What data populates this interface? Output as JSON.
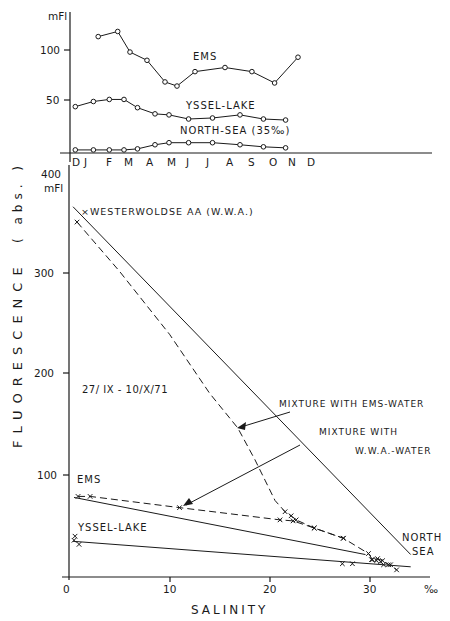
{
  "chart_data": [
    {
      "type": "line",
      "title": "Seasonal fluorescence",
      "xlabel": "",
      "ylabel": "mFl",
      "ylim": [
        0,
        125
      ],
      "yticks": [
        50,
        100
      ],
      "ytick_labels": [
        "50",
        "100"
      ],
      "y_unit_label": "mFl",
      "categories": [
        "D",
        "J",
        "F",
        "M",
        "A",
        "M",
        "J",
        "J",
        "A",
        "S",
        "O",
        "N",
        "D"
      ],
      "grid": false,
      "marker": "open-circle",
      "series": [
        {
          "name": "EMS",
          "x": [
            1.7,
            2.7,
            3.4,
            4.4,
            5.3,
            5.9,
            7.0,
            8.2,
            9.3,
            10.3,
            11.4
          ],
          "values": [
            113,
            118,
            98,
            90,
            69,
            65,
            79,
            83,
            79,
            68,
            93
          ]
        },
        {
          "name": "YSSEL-LAKE",
          "x": [
            0.1,
            1.4,
            2.3,
            3.0,
            3.9,
            4.8,
            5.5,
            6.6,
            7.7,
            8.8,
            9.8,
            10.8
          ],
          "values": [
            45,
            50,
            52,
            52,
            44,
            38,
            37,
            33,
            34,
            37,
            33,
            32
          ]
        },
        {
          "name": "NORTH-SEA (35‰)",
          "x": [
            0.1,
            1.4,
            2.3,
            3.0,
            3.9,
            4.8,
            5.5,
            6.6,
            7.7,
            8.8,
            9.8,
            10.8
          ],
          "values": [
            3,
            3,
            3,
            3,
            4,
            8,
            10,
            10,
            10,
            8,
            6,
            5
          ]
        }
      ],
      "annotations": [
        "EMS",
        "YSSEL-LAKE",
        "NORTH-SEA (35‰)"
      ]
    },
    {
      "type": "scatter",
      "title": "Fluorescence vs salinity",
      "xlabel": "SALINITY",
      "x_unit_label": "‰",
      "ylabel": "FLUORESCENCE (abs.)",
      "y_unit_label": "mFl",
      "xlim": [
        0,
        36
      ],
      "ylim": [
        0,
        400
      ],
      "xticks": [
        0,
        10,
        20,
        30
      ],
      "yticks": [
        100,
        200,
        300,
        400
      ],
      "grid": false,
      "series": [
        {
          "name": "Westerwoldse AA - North Sea mixing line",
          "style": "solid",
          "x": [
            0.4,
            34
          ],
          "values": [
            363,
            22
          ]
        },
        {
          "name": "Ems - North Sea mixing line",
          "style": "solid",
          "x": [
            0.5,
            29.5
          ],
          "values": [
            78,
            22
          ]
        },
        {
          "name": "Yssel-Lake - North Sea mixing line",
          "style": "solid",
          "x": [
            0.4,
            34
          ],
          "values": [
            35,
            10
          ]
        },
        {
          "name": "Mixture with W.W.A.-water (observed)",
          "style": "dashed",
          "marker": "x",
          "x": [
            0.8,
            5,
            10,
            14,
            16.8,
            18.5,
            19.5,
            20.5,
            21.5,
            22.1,
            22.6,
            24.4,
            27.3,
            29.8,
            30.2,
            30.7,
            31.2,
            31.8,
            32.6
          ],
          "values": [
            348,
            300,
            238,
            180,
            146,
            115,
            95,
            75,
            64,
            60,
            56,
            48,
            38,
            23,
            17,
            18,
            16,
            12,
            7
          ]
        },
        {
          "name": "Mixture with Ems-water (observed)",
          "style": "dashed",
          "marker": "x",
          "x": [
            0.9,
            2.1,
            11,
            21,
            22.3,
            24.4,
            27.3
          ],
          "values": [
            79,
            79,
            68,
            56,
            55,
            48,
            38
          ]
        },
        {
          "name": "Yssel-Lake samples",
          "style": "markers",
          "marker": "x",
          "x": [
            0.6,
            0.5,
            1.0,
            27.2,
            28.2,
            30.1,
            30.6,
            31.0,
            31.3,
            32.0
          ],
          "values": [
            40,
            36,
            32,
            13,
            13,
            17,
            16,
            15,
            12,
            12
          ]
        }
      ],
      "annotations": [
        "WESTERWOLDSE AA (W.W.A.)",
        "27/ IX - 10/X/71",
        "MIXTURE WITH EMS-WATER",
        "MIXTURE WITH W.W.A.-WATER",
        "EMS",
        "YSSEL-LAKE",
        "NORTH SEA"
      ]
    }
  ],
  "top_panel": {
    "unit": "mFl",
    "yticks": [
      "100",
      "50"
    ],
    "months": [
      "D",
      "J",
      "F",
      "M",
      "A",
      "M",
      "J",
      "J",
      "A",
      "S",
      "O",
      "N",
      "D"
    ],
    "labels": {
      "ems": "EMS",
      "yssel": "YSSEL-LAKE",
      "northsea": "NORTH-SEA (35‰)"
    }
  },
  "bottom_panel": {
    "unit": "mFl",
    "yticks": [
      "400",
      "300",
      "200",
      "100"
    ],
    "xticks": [
      "0",
      "10",
      "20",
      "30"
    ],
    "x_unit": "‰",
    "xlabel": "SALINITY",
    "ylabel": "FLUORESCENCE",
    "ylabel_suffix": "( abs. )",
    "labels": {
      "wwa": "×WESTERWOLDSE  AA (W.W.A.)",
      "date": "27/ IX - 10/X/71",
      "mix_ems": "MIXTURE  WITH EMS-WATER",
      "mix_wwa_1": "MIXTURE WITH",
      "mix_wwa_2": "W.W.A.-WATER",
      "ems": "EMS",
      "yssel": "YSSEL-LAKE",
      "north": "NORTH",
      "sea": "SEA"
    }
  }
}
